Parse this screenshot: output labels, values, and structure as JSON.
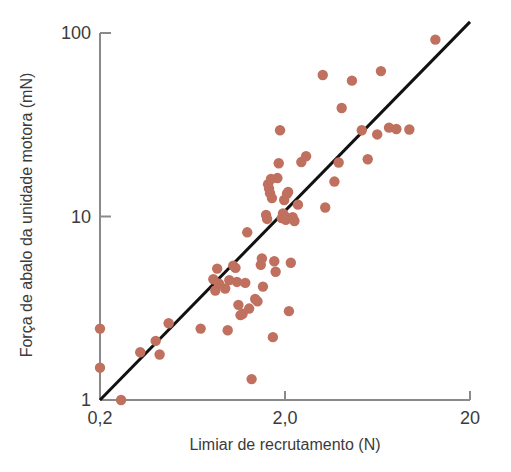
{
  "chart_data": {
    "type": "scatter",
    "title": "",
    "xlabel": "Limiar de recrutamento (N)",
    "ylabel": "Força de abalo da unidade motora (mN)",
    "xscale": "log",
    "yscale": "log",
    "xlim": [
      0.2,
      20
    ],
    "ylim": [
      1,
      100
    ],
    "xticks": [
      0.2,
      2.0,
      20
    ],
    "xticklabels": [
      "0,2",
      "2,0",
      "20"
    ],
    "yticks": [
      1,
      10,
      100
    ],
    "yticklabels": [
      "1",
      "10",
      "100"
    ],
    "grid": false,
    "legend": null,
    "marker_color": "#c0705f",
    "line_color": "#111111",
    "axis_color": "#808080",
    "series": [
      {
        "name": "unidades motoras",
        "marker": "circle",
        "points": [
          [
            0.2,
            2.45
          ],
          [
            0.2,
            1.5
          ],
          [
            0.26,
            1.0
          ],
          [
            0.33,
            1.82
          ],
          [
            0.4,
            2.1
          ],
          [
            0.42,
            1.77
          ],
          [
            0.47,
            2.62
          ],
          [
            0.7,
            2.45
          ],
          [
            0.82,
            4.55
          ],
          [
            0.84,
            3.95
          ],
          [
            0.86,
            5.2
          ],
          [
            0.88,
            4.3
          ],
          [
            0.95,
            4.05
          ],
          [
            0.98,
            2.4
          ],
          [
            1.0,
            4.5
          ],
          [
            1.05,
            5.4
          ],
          [
            1.08,
            5.25
          ],
          [
            1.1,
            4.4
          ],
          [
            1.12,
            3.3
          ],
          [
            1.15,
            2.9
          ],
          [
            1.18,
            2.95
          ],
          [
            1.22,
            4.35
          ],
          [
            1.25,
            8.2
          ],
          [
            1.28,
            3.15
          ],
          [
            1.32,
            1.3
          ],
          [
            1.38,
            3.55
          ],
          [
            1.42,
            3.45
          ],
          [
            1.48,
            5.45
          ],
          [
            1.5,
            5.9
          ],
          [
            1.52,
            4.15
          ],
          [
            1.58,
            10.2
          ],
          [
            1.6,
            9.7
          ],
          [
            1.62,
            15.0
          ],
          [
            1.64,
            14.2
          ],
          [
            1.66,
            13.4
          ],
          [
            1.68,
            16.0
          ],
          [
            1.7,
            12.6
          ],
          [
            1.72,
            2.2
          ],
          [
            1.75,
            5.7
          ],
          [
            1.78,
            5.0
          ],
          [
            1.82,
            16.2
          ],
          [
            1.85,
            19.5
          ],
          [
            1.88,
            29.5
          ],
          [
            1.92,
            9.8
          ],
          [
            1.95,
            10.4
          ],
          [
            1.98,
            12.3
          ],
          [
            2.0,
            10.0
          ],
          [
            2.02,
            9.6
          ],
          [
            2.05,
            13.3
          ],
          [
            2.08,
            13.6
          ],
          [
            2.1,
            3.05
          ],
          [
            2.15,
            5.6
          ],
          [
            2.2,
            9.9
          ],
          [
            2.25,
            9.45
          ],
          [
            2.35,
            11.6
          ],
          [
            2.45,
            19.8
          ],
          [
            2.6,
            21.3
          ],
          [
            3.2,
            59.0
          ],
          [
            3.3,
            11.2
          ],
          [
            3.7,
            15.5
          ],
          [
            3.9,
            19.7
          ],
          [
            4.05,
            39.0
          ],
          [
            4.6,
            55.0
          ],
          [
            5.2,
            29.5
          ],
          [
            5.6,
            20.5
          ],
          [
            6.3,
            28.0
          ],
          [
            6.6,
            62.0
          ],
          [
            7.3,
            30.5
          ],
          [
            8.0,
            30.0
          ],
          [
            9.4,
            29.8
          ],
          [
            13.0,
            92.0
          ]
        ]
      }
    ],
    "fit_line": {
      "description": "linha de regressao",
      "x_start": 0.2,
      "y_start": 1.0,
      "x_end": 20,
      "y_end": 115
    }
  }
}
